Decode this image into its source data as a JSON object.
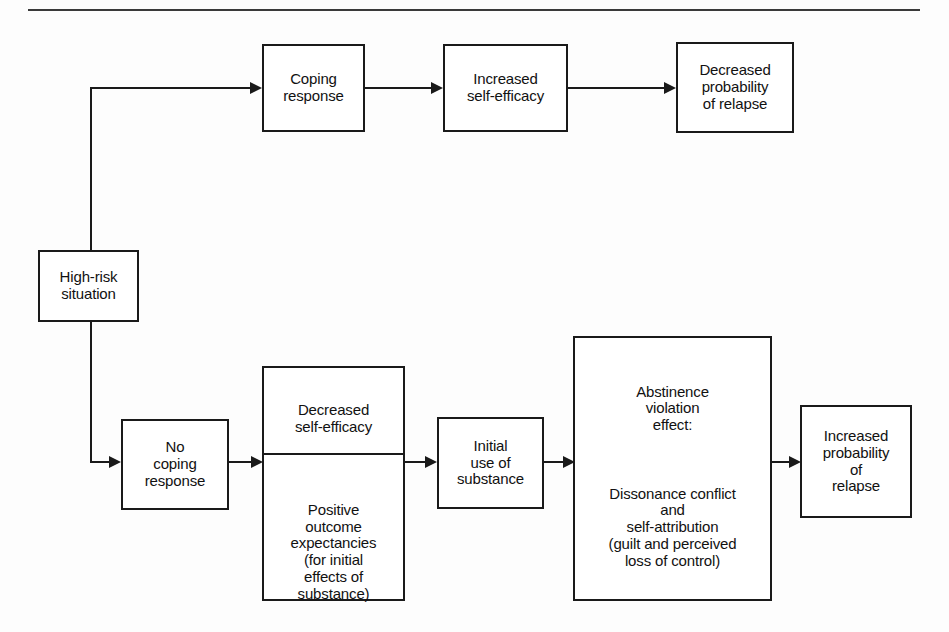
{
  "figure": {
    "rule_label": "horizontal-rule"
  },
  "nodes": {
    "high_risk": "High-risk\nsituation",
    "coping_response": "Coping\nresponse",
    "increased_self_efficacy": "Increased\nself-efficacy",
    "decreased_probability": "Decreased\nprobability\nof relapse",
    "no_coping_response": "No\ncoping\nresponse",
    "decreased_self_efficacy": "Decreased\nself-efficacy",
    "positive_outcome": "Positive\noutcome\nexpectancies\n(for initial\neffects of\nsubstance)",
    "initial_use": "Initial\nuse of\nsubstance",
    "abstinence_violation_heading": "Abstinence\nviolation\neffect:",
    "abstinence_violation_body": "Dissonance conflict\nand\nself-attribution\n(guilt and perceived\nloss of control)",
    "increased_probability": "Increased\nprobability\nof\nrelapse"
  },
  "connectors": [
    {
      "name": "high-risk-to-coping-branch",
      "from": "high_risk",
      "to": "coping_response"
    },
    {
      "name": "coping-to-increased-self-efficacy",
      "from": "coping_response",
      "to": "increased_self_efficacy"
    },
    {
      "name": "increased-self-efficacy-to-decreased-probability",
      "from": "increased_self_efficacy",
      "to": "decreased_probability"
    },
    {
      "name": "high-risk-to-no-coping-branch",
      "from": "high_risk",
      "to": "no_coping_response"
    },
    {
      "name": "no-coping-to-expectancies",
      "from": "no_coping_response",
      "to": "positive_outcome"
    },
    {
      "name": "expectancies-to-initial-use",
      "from": "positive_outcome",
      "to": "initial_use"
    },
    {
      "name": "initial-use-to-abstinence-violation",
      "from": "initial_use",
      "to": "abstinence_violation_heading"
    },
    {
      "name": "abstinence-violation-to-increased-probability",
      "from": "abstinence_violation_heading",
      "to": "increased_probability"
    }
  ],
  "colors": {
    "stroke": "#1a1a1a",
    "rule": "#3a3a3a",
    "box_fill": "#ffffff",
    "page_background": "#fdfdfd"
  }
}
